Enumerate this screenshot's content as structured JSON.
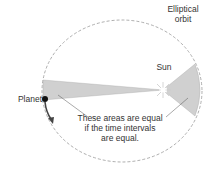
{
  "diagram": {
    "title_label": "Elliptical orbit",
    "orbit_label_line1": "Elliptical",
    "orbit_label_line2": "orbit",
    "sun_label": "Sun",
    "planet_label": "Planet",
    "note_line1": "These areas are equal",
    "note_line2": "if the time intervals",
    "note_line3": "are equal.",
    "colors": {
      "orbit": "#999999",
      "sector_fill": "#d0d0d0",
      "planet": "#111111",
      "arrow": "#444444",
      "text": "#333333"
    }
  }
}
